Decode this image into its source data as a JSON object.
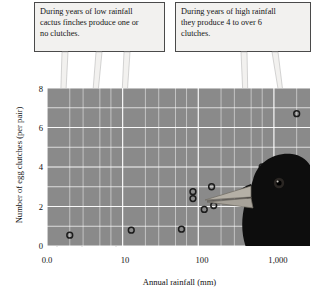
{
  "callouts": [
    {
      "id": "low-rainfall",
      "lines": [
        "During years of low rainfall",
        "cactus finches produce one or",
        "no clutches."
      ]
    },
    {
      "id": "high-rainfall",
      "lines": [
        "During years of high rainfall",
        "they produce 4 to over 6",
        "clutches."
      ]
    }
  ],
  "image": {
    "finch_label": "cactus-finch-head-photo"
  },
  "colors": {
    "plot_background": "#8a8a8a",
    "gridline": "#ffffff",
    "callout_background": "#f2f1ef",
    "callout_border": "#4a4a4a",
    "marker_outline": "#1c1c1c",
    "pointer_fill": "#f2f1ef",
    "pointer_stroke": "#9a9a9a"
  },
  "chart_data": {
    "type": "scatter",
    "title": "",
    "xlabel": "Annual rainfall (mm)",
    "ylabel": "Number of egg clutches (per pair)",
    "x_scale": "log",
    "y_scale": "linear",
    "xlim": [
      1,
      3000
    ],
    "ylim": [
      0,
      8
    ],
    "grid": true,
    "legend": "none",
    "x_tick_labels": [
      "0.0",
      "10",
      "100",
      "1,000"
    ],
    "x_tick_values": [
      1,
      10,
      100,
      1000
    ],
    "y_tick_labels": [
      "0",
      "2",
      "4",
      "6",
      "8"
    ],
    "y_tick_values": [
      0,
      2,
      4,
      6,
      8
    ],
    "y_minor_ticks": [
      1,
      3,
      5,
      7
    ],
    "points": [
      {
        "x": 2,
        "y": 0.55
      },
      {
        "x": 13,
        "y": 0.8
      },
      {
        "x": 60,
        "y": 0.85
      },
      {
        "x": 85,
        "y": 2.75
      },
      {
        "x": 85,
        "y": 2.4
      },
      {
        "x": 120,
        "y": 1.85
      },
      {
        "x": 160,
        "y": 2.05
      },
      {
        "x": 150,
        "y": 3.0
      },
      {
        "x": 700,
        "y": 4.0
      },
      {
        "x": 2000,
        "y": 6.7
      }
    ]
  }
}
